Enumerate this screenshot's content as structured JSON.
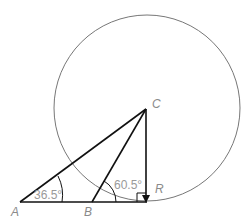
{
  "diagram": {
    "type": "geometry",
    "circle": {
      "center_label": "C",
      "cx": 147,
      "cy": 108,
      "r": 93
    },
    "points": [
      {
        "label": "A",
        "x": 20,
        "y": 202
      },
      {
        "label": "B",
        "x": 92,
        "y": 202
      },
      {
        "label": "C",
        "x": 146,
        "y": 108
      },
      {
        "label": "R",
        "x": 146,
        "y": 202
      }
    ],
    "segments": [
      "AC",
      "BC",
      "CR",
      "AR"
    ],
    "angles": [
      {
        "vertex": "A",
        "value": "36.5°"
      },
      {
        "vertex": "B",
        "value": "60.5°"
      },
      {
        "vertex": "R",
        "value": "90°",
        "marker": "right-angle"
      }
    ],
    "labels": {
      "A": "A",
      "B": "B",
      "C": "C",
      "R": "R",
      "angle_A": "36.5°",
      "angle_B": "60.5°"
    },
    "colors": {
      "lines": "#111111",
      "circle": "#777777",
      "labels": "#8a8a8a"
    }
  }
}
